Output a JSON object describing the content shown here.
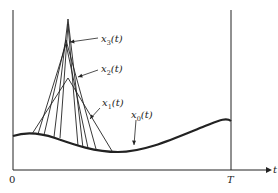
{
  "diagram": {
    "axes": {
      "origin_label": "0",
      "end_label": "T",
      "t_axis_label": "t"
    },
    "curves": [
      {
        "id": "x0",
        "label_base": "x",
        "label_sub": "0",
        "label_arg": "(t)",
        "style": "thick"
      },
      {
        "id": "x1",
        "label_base": "x",
        "label_sub": "1",
        "label_arg": "(t)",
        "style": "thin"
      },
      {
        "id": "x2",
        "label_base": "x",
        "label_sub": "2",
        "label_arg": "(t)",
        "style": "thin"
      },
      {
        "id": "x3",
        "label_base": "x",
        "label_sub": "3",
        "label_arg": "(t)",
        "style": "thin"
      }
    ],
    "colors": {
      "ink": "#222222",
      "background": "#ffffff"
    }
  }
}
